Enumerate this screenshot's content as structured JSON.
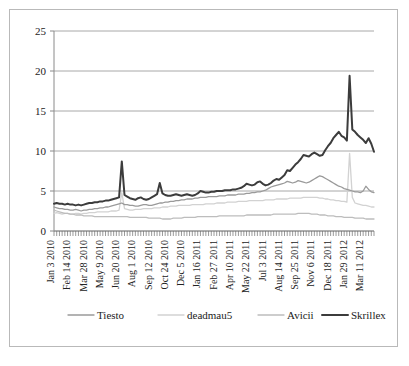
{
  "chart_data": {
    "type": "line",
    "title": "",
    "subtitle": "",
    "xlabel": "",
    "ylabel": "",
    "ylim": [
      0,
      25
    ],
    "yticks": [
      0,
      5,
      10,
      15,
      20,
      25
    ],
    "ytick_labels": [
      "0",
      "5",
      "10",
      "15",
      "20",
      "25"
    ],
    "grid": true,
    "legend_position": "bottom",
    "x_tick_labels": [
      "Jan 3 2010",
      "Feb 14 2010",
      "Mar 28 2010",
      "May 9 2010",
      "Jun 20 2010",
      "Aug 1 2010",
      "Sep 12 2010",
      "Oct 24 2010",
      "Dec 5 2010",
      "Jan 16 2011",
      "Feb 27 2011",
      "Apr 10 2011",
      "May 22 2011",
      "Jul 3 2011",
      "Aug 14 2011",
      "Sep 25 2011",
      "Nov 6 2011",
      "Dec 18 2011",
      "Jan 29 2012",
      "Mar 11 2012"
    ],
    "x_tick_interval_weeks": 6,
    "n_points": 119,
    "series": [
      {
        "name": "Tiesto",
        "color": "#9a9a9a",
        "width": 1.3,
        "values": [
          3.0,
          2.9,
          2.8,
          2.8,
          2.7,
          2.7,
          2.6,
          2.6,
          2.7,
          2.6,
          2.5,
          2.6,
          2.6,
          2.7,
          2.7,
          2.8,
          2.8,
          2.9,
          2.9,
          3.0,
          3.0,
          3.1,
          3.2,
          3.3,
          3.4,
          3.5,
          3.3,
          3.3,
          3.2,
          3.2,
          3.1,
          3.1,
          3.2,
          3.3,
          3.3,
          3.2,
          3.2,
          3.3,
          3.4,
          3.5,
          3.5,
          3.6,
          3.6,
          3.7,
          3.7,
          3.8,
          3.8,
          3.9,
          3.9,
          4.0,
          4.0,
          4.0,
          4.1,
          4.1,
          4.2,
          4.2,
          4.2,
          4.3,
          4.3,
          4.3,
          4.3,
          4.4,
          4.4,
          4.4,
          4.5,
          4.5,
          4.5,
          4.5,
          4.6,
          4.6,
          4.6,
          4.7,
          4.7,
          4.8,
          4.8,
          4.9,
          4.9,
          5.0,
          5.1,
          5.3,
          5.5,
          5.6,
          5.7,
          5.8,
          5.9,
          6.0,
          6.2,
          6.1,
          6.0,
          6.1,
          6.3,
          6.2,
          6.1,
          6.0,
          6.1,
          6.3,
          6.5,
          6.7,
          6.9,
          6.8,
          6.6,
          6.4,
          6.2,
          6.0,
          5.8,
          5.6,
          5.5,
          5.3,
          5.2,
          5.1,
          5.0,
          4.9,
          4.9,
          4.8,
          5.0,
          5.6,
          5.2,
          4.9,
          4.8
        ]
      },
      {
        "name": "deadmau5",
        "color": "#d2d2d2",
        "width": 1.3,
        "values": [
          2.2,
          2.3,
          2.2,
          2.1,
          2.2,
          2.2,
          2.1,
          2.1,
          2.2,
          2.2,
          2.1,
          2.2,
          2.2,
          2.3,
          2.3,
          2.3,
          2.4,
          2.4,
          2.4,
          2.4,
          2.4,
          2.5,
          2.5,
          2.5,
          2.6,
          4.8,
          2.8,
          2.7,
          2.6,
          2.6,
          2.7,
          2.7,
          2.7,
          2.8,
          2.8,
          2.8,
          2.8,
          2.9,
          2.9,
          2.9,
          3.0,
          3.0,
          3.0,
          3.1,
          3.1,
          3.1,
          3.2,
          3.2,
          3.2,
          3.2,
          3.2,
          3.3,
          3.3,
          3.3,
          3.3,
          3.3,
          3.4,
          3.4,
          3.4,
          3.4,
          3.5,
          3.5,
          3.5,
          3.5,
          3.6,
          3.6,
          3.6,
          3.6,
          3.7,
          3.7,
          3.7,
          3.7,
          3.8,
          3.8,
          3.8,
          3.8,
          3.8,
          3.8,
          3.9,
          3.9,
          3.9,
          3.9,
          4.0,
          4.0,
          4.0,
          4.0,
          4.0,
          4.1,
          4.1,
          4.1,
          4.1,
          4.1,
          4.2,
          4.2,
          4.2,
          4.2,
          4.2,
          4.2,
          4.1,
          4.1,
          4.0,
          4.0,
          3.9,
          3.9,
          3.8,
          3.8,
          3.7,
          3.7,
          3.6,
          9.7,
          4.2,
          3.5,
          3.4,
          3.3,
          3.2,
          3.2,
          3.1,
          3.0,
          3.0
        ]
      },
      {
        "name": "Avicii",
        "color": "#bdbdbd",
        "width": 1.3,
        "values": [
          2.6,
          2.5,
          2.4,
          2.3,
          2.2,
          2.2,
          2.1,
          2.1,
          2.0,
          2.0,
          2.0,
          1.9,
          1.9,
          1.9,
          1.9,
          1.8,
          1.8,
          1.8,
          1.8,
          1.8,
          1.8,
          1.8,
          1.8,
          1.8,
          1.8,
          1.8,
          1.8,
          1.8,
          1.7,
          1.7,
          1.7,
          1.7,
          1.7,
          1.7,
          1.7,
          1.6,
          1.6,
          1.6,
          1.6,
          1.6,
          1.5,
          1.5,
          1.5,
          1.5,
          1.6,
          1.6,
          1.6,
          1.6,
          1.7,
          1.7,
          1.7,
          1.7,
          1.7,
          1.8,
          1.8,
          1.8,
          1.8,
          1.8,
          1.8,
          1.8,
          1.8,
          1.9,
          1.9,
          1.9,
          1.9,
          1.9,
          1.9,
          1.9,
          1.9,
          1.9,
          1.9,
          2.0,
          2.0,
          2.0,
          2.0,
          2.0,
          2.0,
          2.0,
          2.0,
          2.0,
          2.0,
          2.1,
          2.1,
          2.1,
          2.1,
          2.1,
          2.1,
          2.1,
          2.1,
          2.1,
          2.2,
          2.2,
          2.2,
          2.2,
          2.2,
          2.1,
          2.1,
          2.1,
          2.0,
          2.0,
          2.0,
          1.9,
          1.9,
          1.9,
          1.8,
          1.8,
          1.8,
          1.7,
          1.7,
          1.7,
          1.7,
          1.6,
          1.6,
          1.6,
          1.6,
          1.5,
          1.5,
          1.5,
          1.5
        ]
      },
      {
        "name": "Skrillex",
        "color": "#3c3c3c",
        "width": 2.0,
        "values": [
          3.4,
          3.5,
          3.4,
          3.4,
          3.3,
          3.4,
          3.3,
          3.3,
          3.2,
          3.3,
          3.2,
          3.3,
          3.4,
          3.5,
          3.5,
          3.6,
          3.6,
          3.7,
          3.7,
          3.8,
          3.8,
          3.9,
          4.0,
          4.1,
          4.2,
          8.7,
          4.5,
          4.3,
          4.1,
          4.0,
          3.9,
          4.1,
          4.2,
          4.0,
          3.9,
          4.0,
          4.2,
          4.4,
          4.6,
          6.0,
          4.7,
          4.5,
          4.4,
          4.4,
          4.5,
          4.6,
          4.5,
          4.4,
          4.5,
          4.6,
          4.5,
          4.4,
          4.5,
          4.7,
          5.0,
          4.9,
          4.8,
          4.8,
          4.9,
          4.9,
          5.0,
          5.0,
          5.0,
          5.1,
          5.1,
          5.1,
          5.2,
          5.2,
          5.3,
          5.4,
          5.6,
          5.9,
          5.8,
          5.7,
          5.8,
          6.1,
          6.2,
          5.9,
          5.7,
          5.8,
          6.0,
          6.3,
          6.5,
          6.4,
          6.7,
          7.0,
          7.6,
          7.5,
          7.9,
          8.3,
          8.6,
          9.0,
          9.5,
          9.4,
          9.3,
          9.6,
          9.8,
          9.6,
          9.4,
          9.5,
          10.1,
          10.6,
          11.0,
          11.6,
          12.0,
          12.4,
          11.9,
          11.7,
          11.3,
          19.4,
          12.7,
          12.4,
          12.0,
          11.7,
          11.4,
          11.0,
          11.6,
          10.9,
          9.9
        ]
      }
    ]
  },
  "legend": {
    "items": [
      {
        "label": "Tiesto"
      },
      {
        "label": "deadmau5"
      },
      {
        "label": "Avicii"
      },
      {
        "label": "Skrillex"
      }
    ]
  }
}
